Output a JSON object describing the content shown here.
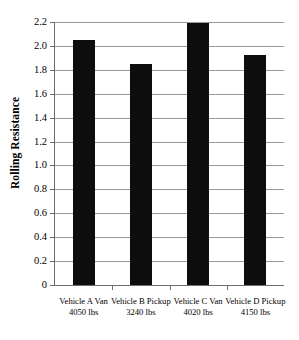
{
  "chart_data": {
    "type": "bar",
    "title": "",
    "xlabel": "",
    "ylabel": "Rolling Resistance",
    "ylim": [
      0,
      2.2
    ],
    "grid": true,
    "legend": "none",
    "orientation": "vertical",
    "bar_color": "#0d0d0d",
    "grid_color": "#9a9a9a",
    "axis_color": "#6d6d6d",
    "background": "#ffffff",
    "categories": [
      "Vehicle A Van 4050 lbs",
      "Vehicle B Pickup 3240 lbs",
      "Vehicle C Van 4020 lbs",
      "Vehicle D Pickup 4150 lbs"
    ],
    "category_lines": [
      {
        "line1": "Vehicle A Van",
        "line2": "4050 lbs"
      },
      {
        "line1": "Vehicle B Pickup",
        "line2": "3240 lbs"
      },
      {
        "line1": "Vehicle C Van",
        "line2": "4020 lbs"
      },
      {
        "line1": "Vehicle D Pickup",
        "line2": "4150 lbs"
      }
    ],
    "values": [
      2.05,
      1.85,
      2.19,
      1.92
    ],
    "yticks": [
      0,
      0.2,
      0.4,
      0.6,
      0.8,
      1.0,
      1.2,
      1.4,
      1.6,
      1.8,
      2.0,
      2.2
    ],
    "ytick_labels": [
      "0",
      "0.2",
      "0.4",
      "0.6",
      "0.8",
      "1.0",
      "1.2",
      "1.4",
      "1.6",
      "1.8",
      "2.0",
      "2.2"
    ]
  }
}
